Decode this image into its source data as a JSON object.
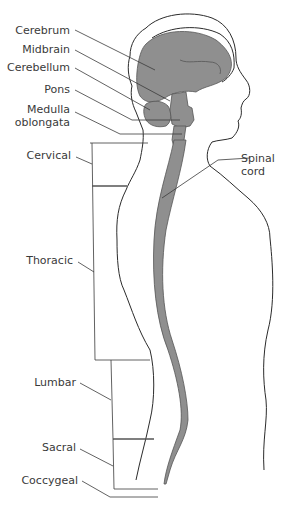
{
  "diagram": {
    "colors": {
      "tissue_fill": "#8f8f8f",
      "outline": "#2b2b2b",
      "text": "#3a3a3a",
      "background": "#ffffff"
    },
    "brain_labels": [
      {
        "id": "cerebrum",
        "text": "Cerebrum"
      },
      {
        "id": "midbrain",
        "text": "Midbrain"
      },
      {
        "id": "cerebellum",
        "text": "Cerebellum"
      },
      {
        "id": "pons",
        "text": "Pons"
      },
      {
        "id": "medulla",
        "text": "Medulla oblongata",
        "lines": [
          "Medulla",
          "oblongata"
        ]
      }
    ],
    "spinal_labels": [
      {
        "id": "cervical",
        "text": "Cervical"
      },
      {
        "id": "thoracic",
        "text": "Thoracic"
      },
      {
        "id": "lumbar",
        "text": "Lumbar"
      },
      {
        "id": "sacral",
        "text": "Sacral"
      },
      {
        "id": "coccygeal",
        "text": "Coccygeal"
      }
    ],
    "cord_label": {
      "id": "spinal-cord",
      "text": "Spinal cord",
      "lines": [
        "Spinal",
        "cord"
      ]
    }
  }
}
